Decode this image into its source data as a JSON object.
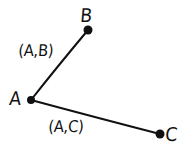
{
  "diagram": {
    "type": "undirected-graph",
    "canvas": {
      "width": 188,
      "height": 151,
      "background": "#ffffff"
    },
    "ink_color": "#111111",
    "style": "hand-drawn",
    "nodes": [
      {
        "id": "A",
        "label": "A",
        "x": 31,
        "y": 100,
        "radius": 4,
        "label_x": 10,
        "label_y": 89
      },
      {
        "id": "B",
        "label": "B",
        "x": 88,
        "y": 30,
        "radius": 4.5,
        "label_x": 81,
        "label_y": 6
      },
      {
        "id": "C",
        "label": "C",
        "x": 160,
        "y": 134,
        "radius": 4.5,
        "label_x": 166,
        "label_y": 125
      }
    ],
    "edges": [
      {
        "id": "AB",
        "from": "A",
        "to": "B",
        "label": "(A,B)",
        "label_x": 19,
        "label_y": 43,
        "path": "M 31 100 Q 57 67 88 30"
      },
      {
        "id": "AC",
        "from": "A",
        "to": "C",
        "label": "(A,C)",
        "label_x": 49,
        "label_y": 119,
        "path": "M 31 100 Q 98 118 160 134"
      }
    ]
  }
}
